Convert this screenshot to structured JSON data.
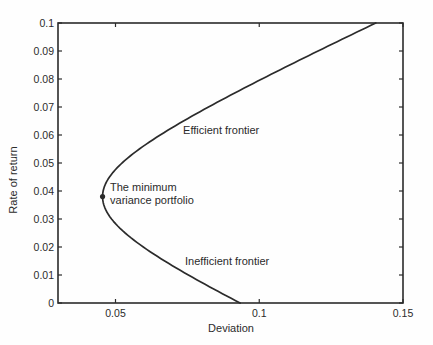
{
  "figure": {
    "background": "#fefefe",
    "ink_color": "#2b2b2b"
  },
  "chart_data": {
    "type": "line",
    "title": "",
    "xlabel": "Deviation",
    "ylabel": "Rate of return",
    "xlim": [
      0.03,
      0.15
    ],
    "ylim": [
      0,
      0.1
    ],
    "grid": false,
    "box": true,
    "xticks": {
      "values": [
        0.05,
        0.1,
        0.15
      ],
      "labels": [
        "0.05",
        "0.1",
        "0.15"
      ]
    },
    "yticks": {
      "values": [
        0,
        0.01,
        0.02,
        0.03,
        0.04,
        0.05,
        0.06,
        0.07,
        0.08,
        0.09,
        0.1
      ],
      "labels": [
        "0",
        "0.01",
        "0.02",
        "0.03",
        "0.04",
        "0.05",
        "0.06",
        "0.07",
        "0.08",
        "0.09",
        "0.1"
      ]
    },
    "series": [
      {
        "name": "mean-variance frontier",
        "model": "sigma = sqrt(sigma0^2 + b*(mu - mu0)^2)",
        "params": {
          "sigma0": 0.0455,
          "mu0": 0.038,
          "b": 4.6
        },
        "mu_range": [
          0,
          0.1
        ],
        "points_mu_sigma": [
          [
            0.0,
            0.0933
          ],
          [
            0.01,
            0.0753
          ],
          [
            0.02,
            0.0597
          ],
          [
            0.03,
            0.0486
          ],
          [
            0.038,
            0.0455
          ],
          [
            0.04,
            0.0457
          ],
          [
            0.05,
            0.0523
          ],
          [
            0.06,
            0.0656
          ],
          [
            0.07,
            0.0823
          ],
          [
            0.08,
            0.1009
          ],
          [
            0.09,
            0.1204
          ],
          [
            0.1,
            0.1405
          ]
        ]
      }
    ],
    "marker": {
      "x": 0.0455,
      "y": 0.038,
      "label": "minimum variance portfolio"
    },
    "annotations": [
      {
        "id": "efficient-frontier-label",
        "text": "Efficient frontier",
        "x": 0.0735,
        "y": 0.0617,
        "align": "left-middle"
      },
      {
        "id": "min-variance-label",
        "text": "The minimum\nvariance portfolio",
        "x": 0.0481,
        "y": 0.0436,
        "align": "left-top"
      },
      {
        "id": "inefficient-frontier-label",
        "text": "Inefficient frontier",
        "x": 0.0742,
        "y": 0.015,
        "align": "left-middle"
      }
    ]
  }
}
